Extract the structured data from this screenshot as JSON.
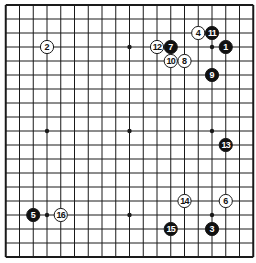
{
  "diagram": {
    "type": "go-board",
    "size": 19,
    "geometry": {
      "x0": 5.75,
      "y0": 5,
      "dx": 13.75,
      "dy": 14
    },
    "colors": {
      "line": "#1a1a1a",
      "background": "#ffffff",
      "black_stone": "#111111",
      "white_stone": "#ffffff"
    },
    "star_points": [
      [
        3,
        3
      ],
      [
        9,
        3
      ],
      [
        15,
        3
      ],
      [
        3,
        9
      ],
      [
        9,
        9
      ],
      [
        15,
        9
      ],
      [
        3,
        15
      ],
      [
        9,
        15
      ],
      [
        15,
        15
      ]
    ],
    "stones": [
      {
        "move": "1",
        "color": "black",
        "col": 16,
        "row": 3
      },
      {
        "move": "2",
        "color": "white",
        "col": 3,
        "row": 3
      },
      {
        "move": "3",
        "color": "black",
        "col": 15,
        "row": 16
      },
      {
        "move": "4",
        "color": "white",
        "col": 14,
        "row": 2
      },
      {
        "move": "5",
        "color": "black",
        "col": 2,
        "row": 15
      },
      {
        "move": "6",
        "color": "white",
        "col": 16,
        "row": 14
      },
      {
        "move": "7",
        "color": "black",
        "col": 12,
        "row": 3
      },
      {
        "move": "8",
        "color": "white",
        "col": 13,
        "row": 4
      },
      {
        "move": "9",
        "color": "black",
        "col": 15,
        "row": 5
      },
      {
        "move": "10",
        "color": "white",
        "col": 12,
        "row": 4
      },
      {
        "move": "11",
        "color": "black",
        "col": 15,
        "row": 2
      },
      {
        "move": "12",
        "color": "white",
        "col": 11,
        "row": 3
      },
      {
        "move": "13",
        "color": "black",
        "col": 16,
        "row": 10
      },
      {
        "move": "14",
        "color": "white",
        "col": 13,
        "row": 14
      },
      {
        "move": "15",
        "color": "black",
        "col": 12,
        "row": 16
      },
      {
        "move": "16",
        "color": "white",
        "col": 4,
        "row": 15
      }
    ]
  }
}
